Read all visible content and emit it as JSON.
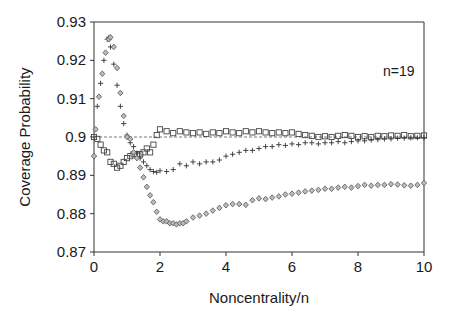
{
  "chart_data": {
    "type": "scatter",
    "title": "",
    "xlabel": "Noncentrality/n",
    "ylabel": "Coverage Probability",
    "xlim": [
      0,
      10
    ],
    "ylim": [
      0.87,
      0.93
    ],
    "xticks": [
      0,
      2,
      4,
      6,
      8,
      10
    ],
    "xtick_labels": [
      "0",
      "2",
      "4",
      "6",
      "8",
      "10"
    ],
    "yticks": [
      0.87,
      0.88,
      0.89,
      0.9,
      0.91,
      0.92,
      0.93
    ],
    "ytick_labels": [
      "0.87",
      "0.88",
      "0.89",
      "0.9",
      "0.91",
      "0.92",
      "0.93"
    ],
    "grid": false,
    "legend": null,
    "annotations": [
      {
        "text": "n=19",
        "x": 9.3,
        "y": 0.916
      }
    ],
    "reference_line": {
      "y": 0.9,
      "style": "dashed"
    },
    "series": [
      {
        "name": "squares",
        "marker": "square",
        "x": [
          0,
          0.1,
          0.2,
          0.3,
          0.4,
          0.5,
          0.6,
          0.7,
          0.8,
          0.9,
          1.0,
          1.1,
          1.2,
          1.3,
          1.4,
          1.5,
          1.6,
          1.7,
          1.8,
          1.9,
          2.0,
          2.2,
          2.4,
          2.6,
          2.8,
          3.0,
          3.2,
          3.4,
          3.6,
          3.8,
          4.0,
          4.2,
          4.4,
          4.6,
          4.8,
          5.0,
          5.2,
          5.4,
          5.6,
          5.8,
          6.0,
          6.2,
          6.4,
          6.6,
          6.8,
          7.0,
          7.2,
          7.4,
          7.6,
          7.8,
          8.0,
          8.2,
          8.4,
          8.6,
          8.8,
          9.0,
          9.2,
          9.4,
          9.6,
          9.8,
          10.0
        ],
        "values": [
          0.9,
          0.8995,
          0.898,
          0.8965,
          0.896,
          0.8935,
          0.893,
          0.892,
          0.8925,
          0.8935,
          0.8945,
          0.895,
          0.8955,
          0.8955,
          0.8955,
          0.896,
          0.897,
          0.896,
          0.898,
          0.9005,
          0.902,
          0.9015,
          0.901,
          0.9015,
          0.9012,
          0.901,
          0.9012,
          0.9008,
          0.9012,
          0.901,
          0.9015,
          0.9012,
          0.901,
          0.9015,
          0.9012,
          0.9015,
          0.9012,
          0.901,
          0.9012,
          0.901,
          0.9012,
          0.9008,
          0.9005,
          0.9003,
          0.9,
          0.9002,
          0.9,
          0.9003,
          0.9005,
          0.9003,
          0.9,
          0.9002,
          0.9,
          0.9003,
          0.9002,
          0.9004,
          0.9003,
          0.9005,
          0.9002,
          0.9003,
          0.9004
        ]
      },
      {
        "name": "plus",
        "marker": "plus",
        "x": [
          0,
          0.1,
          0.2,
          0.3,
          0.4,
          0.45,
          0.5,
          0.6,
          0.7,
          0.8,
          0.9,
          1.0,
          1.1,
          1.2,
          1.3,
          1.4,
          1.5,
          1.6,
          1.7,
          1.8,
          1.9,
          2.0,
          2.2,
          2.4,
          2.6,
          2.8,
          3.0,
          3.2,
          3.4,
          3.6,
          3.8,
          4.0,
          4.2,
          4.4,
          4.6,
          4.8,
          5.0,
          5.2,
          5.4,
          5.6,
          5.8,
          6.0,
          6.2,
          6.4,
          6.6,
          6.8,
          7.0,
          7.2,
          7.4,
          7.6,
          7.8,
          8.0,
          8.2,
          8.4,
          8.6,
          8.8,
          9.0,
          9.2,
          9.4,
          9.6,
          9.8,
          10.0
        ],
        "values": [
          0.895,
          0.908,
          0.914,
          0.92,
          0.9255,
          0.926,
          0.9235,
          0.919,
          0.9135,
          0.908,
          0.9035,
          0.9005,
          0.8985,
          0.8975,
          0.8958,
          0.8945,
          0.8935,
          0.8925,
          0.8915,
          0.891,
          0.8908,
          0.8912,
          0.891,
          0.8915,
          0.893,
          0.8925,
          0.8935,
          0.893,
          0.8935,
          0.8935,
          0.894,
          0.895,
          0.8955,
          0.896,
          0.8965,
          0.8965,
          0.897,
          0.8975,
          0.8975,
          0.898,
          0.8978,
          0.8982,
          0.898,
          0.8985,
          0.8985,
          0.8982,
          0.8985,
          0.8985,
          0.8988,
          0.8985,
          0.8988,
          0.899,
          0.899,
          0.8992,
          0.8993,
          0.8995,
          0.8995,
          0.8997,
          0.8997,
          0.8998,
          0.8998,
          0.8998
        ]
      },
      {
        "name": "diamonds",
        "marker": "diamond",
        "x": [
          0,
          0.05,
          0.15,
          0.25,
          0.35,
          0.45,
          0.5,
          0.6,
          0.7,
          0.8,
          0.9,
          1.0,
          1.1,
          1.2,
          1.3,
          1.4,
          1.5,
          1.6,
          1.7,
          1.8,
          1.9,
          2.0,
          2.1,
          2.2,
          2.3,
          2.4,
          2.5,
          2.6,
          2.7,
          2.8,
          3.0,
          3.2,
          3.4,
          3.6,
          3.8,
          4.0,
          4.2,
          4.4,
          4.6,
          4.8,
          5.0,
          5.2,
          5.4,
          5.6,
          5.8,
          6.0,
          6.2,
          6.4,
          6.6,
          6.8,
          7.0,
          7.2,
          7.4,
          7.6,
          7.8,
          8.0,
          8.2,
          8.4,
          8.6,
          8.8,
          9.0,
          9.2,
          9.4,
          9.6,
          9.8,
          10.0
        ],
        "values": [
          0.895,
          0.902,
          0.9105,
          0.9165,
          0.922,
          0.9255,
          0.926,
          0.9235,
          0.918,
          0.9115,
          0.9055,
          0.9,
          0.8995,
          0.896,
          0.8945,
          0.892,
          0.8895,
          0.887,
          0.8848,
          0.883,
          0.8805,
          0.8785,
          0.878,
          0.878,
          0.8775,
          0.8775,
          0.8772,
          0.8775,
          0.8775,
          0.878,
          0.879,
          0.8795,
          0.88,
          0.8808,
          0.8815,
          0.8822,
          0.8825,
          0.8825,
          0.8823,
          0.8835,
          0.884,
          0.8838,
          0.8842,
          0.8845,
          0.885,
          0.8852,
          0.8855,
          0.8858,
          0.886,
          0.8862,
          0.8865,
          0.8865,
          0.8868,
          0.887,
          0.8868,
          0.8872,
          0.8875,
          0.8873,
          0.8875,
          0.8875,
          0.8877,
          0.8876,
          0.8874,
          0.8873,
          0.8875,
          0.888
        ]
      }
    ]
  }
}
